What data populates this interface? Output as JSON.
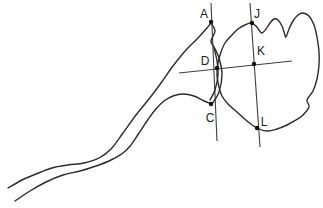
{
  "figure": {
    "canvas": {
      "width": 323,
      "height": 208,
      "background": "#ffffff"
    },
    "style": {
      "outline_color": "#2b2b2b",
      "outline_width": 1.4,
      "line_color": "#3d3d3d",
      "line_width": 1.1,
      "dot_color": "#111111",
      "dot_radius": 2.2,
      "label_color": "#1c1c1c",
      "label_font_size": 12
    },
    "points": [
      {
        "label": "A",
        "x": 211,
        "y": 22,
        "lx": 204,
        "ly": 18
      },
      {
        "label": "J",
        "x": 252,
        "y": 23,
        "lx": 257,
        "ly": 18
      },
      {
        "label": "D",
        "x": 217,
        "y": 68,
        "lx": 205,
        "ly": 65
      },
      {
        "label": "K",
        "x": 254,
        "y": 64,
        "lx": 261,
        "ly": 55
      },
      {
        "label": "C",
        "x": 211,
        "y": 104,
        "lx": 210,
        "ly": 122
      },
      {
        "label": "L",
        "x": 257,
        "y": 128,
        "lx": 264,
        "ly": 126
      }
    ],
    "lines": [
      {
        "name": "tangent-line-AC",
        "x1": 211,
        "y1": 3,
        "x2": 217,
        "y2": 141
      },
      {
        "name": "tangent-line-JL",
        "x1": 250,
        "y1": 3,
        "x2": 260,
        "y2": 147
      },
      {
        "name": "horizontal-line-DK",
        "x1": 179,
        "y1": 73,
        "x2": 292,
        "y2": 61
      }
    ],
    "shapes": [
      {
        "name": "condyle-ramus-outline",
        "closed": false,
        "points": [
          [
            8,
            188
          ],
          [
            22,
            180
          ],
          [
            36,
            174
          ],
          [
            52,
            168
          ],
          [
            68,
            165
          ],
          [
            84,
            163
          ],
          [
            99,
            158
          ],
          [
            111,
            149
          ],
          [
            123,
            133
          ],
          [
            136,
            115
          ],
          [
            149,
            99
          ],
          [
            161,
            83
          ],
          [
            173,
            66
          ],
          [
            186,
            50
          ],
          [
            198,
            38
          ],
          [
            207,
            28
          ],
          [
            211,
            23
          ],
          [
            211,
            23
          ],
          [
            215,
            31
          ],
          [
            211,
            41
          ],
          [
            214,
            47
          ],
          [
            219,
            58
          ],
          [
            222,
            74
          ],
          [
            219,
            92
          ],
          [
            212,
            104
          ],
          [
            212,
            104
          ],
          [
            204,
            101
          ],
          [
            194,
            96
          ],
          [
            183,
            94
          ],
          [
            173,
            96
          ],
          [
            164,
            101
          ],
          [
            155,
            110
          ],
          [
            147,
            121
          ],
          [
            139,
            133
          ],
          [
            131,
            145
          ],
          [
            123,
            153
          ],
          [
            111,
            160
          ],
          [
            96,
            166
          ],
          [
            80,
            171
          ],
          [
            63,
            175
          ],
          [
            46,
            182
          ],
          [
            30,
            191
          ],
          [
            15,
            201
          ]
        ]
      },
      {
        "name": "articular-surface-inner-line",
        "closed": false,
        "points": [
          [
            214,
            48
          ],
          [
            217,
            61
          ],
          [
            218,
            75
          ],
          [
            215,
            90
          ],
          [
            210,
            100
          ]
        ]
      },
      {
        "name": "fossa-bone-outline",
        "closed": true,
        "points": [
          [
            225,
            43
          ],
          [
            231,
            36
          ],
          [
            238,
            29
          ],
          [
            245,
            25
          ],
          [
            251,
            23
          ],
          [
            256,
            26
          ],
          [
            259,
            30
          ],
          [
            262,
            33
          ],
          [
            266,
            29
          ],
          [
            270,
            23
          ],
          [
            274,
            19
          ],
          [
            278,
            20
          ],
          [
            282,
            26
          ],
          [
            284,
            32
          ],
          [
            286,
            37
          ],
          [
            289,
            29
          ],
          [
            293,
            21
          ],
          [
            298,
            15
          ],
          [
            303,
            13
          ],
          [
            309,
            16
          ],
          [
            314,
            25
          ],
          [
            317,
            37
          ],
          [
            319,
            52
          ],
          [
            319,
            65
          ],
          [
            317,
            79
          ],
          [
            313,
            91
          ],
          [
            307,
            100
          ],
          [
            309,
            107
          ],
          [
            302,
            116
          ],
          [
            296,
            120
          ],
          [
            287,
            125
          ],
          [
            277,
            129
          ],
          [
            267,
            131
          ],
          [
            257,
            128
          ],
          [
            247,
            121
          ],
          [
            237,
            112
          ],
          [
            228,
            104
          ],
          [
            222,
            96
          ],
          [
            219,
            87
          ],
          [
            217,
            75
          ],
          [
            218,
            63
          ],
          [
            221,
            52
          ]
        ]
      }
    ]
  }
}
